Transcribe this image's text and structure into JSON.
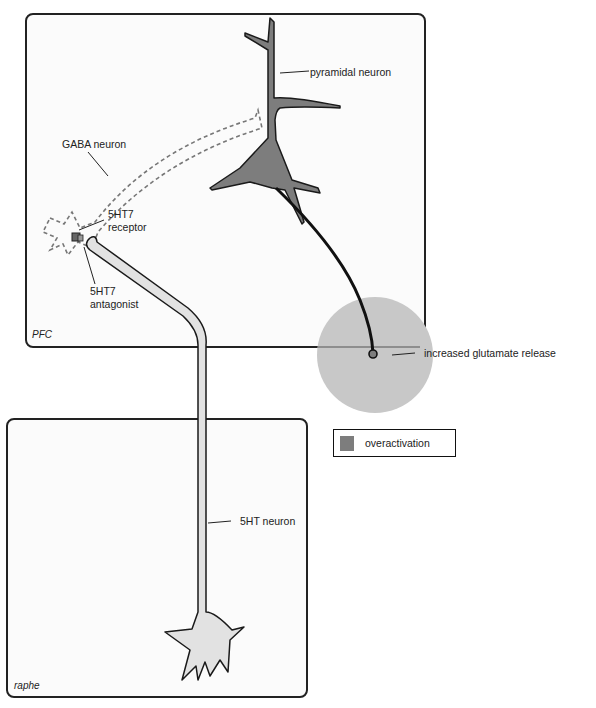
{
  "regions": {
    "pfc": "PFC",
    "raphe": "raphe"
  },
  "labels": {
    "pyramidal_neuron": "pyramidal neuron",
    "gaba_neuron": "GABA neuron",
    "receptor_line1": "5HT7",
    "receptor_line2": "receptor",
    "antagonist_line1": "5HT7",
    "antagonist_line2": "antagonist",
    "glutamate": "increased glutamate release",
    "serotonin_neuron": "5HT neuron"
  },
  "legend": {
    "items": [
      {
        "label": "overactivation",
        "color": "#7d7d7d"
      }
    ]
  },
  "colors": {
    "overactivation": "#7d7d7d",
    "glutamate_release": "#c8c8c8",
    "serotonin_neuron_fill": "#e2e2e2",
    "outline": "#1a1a1a",
    "gaba_dashed": "#777777"
  }
}
